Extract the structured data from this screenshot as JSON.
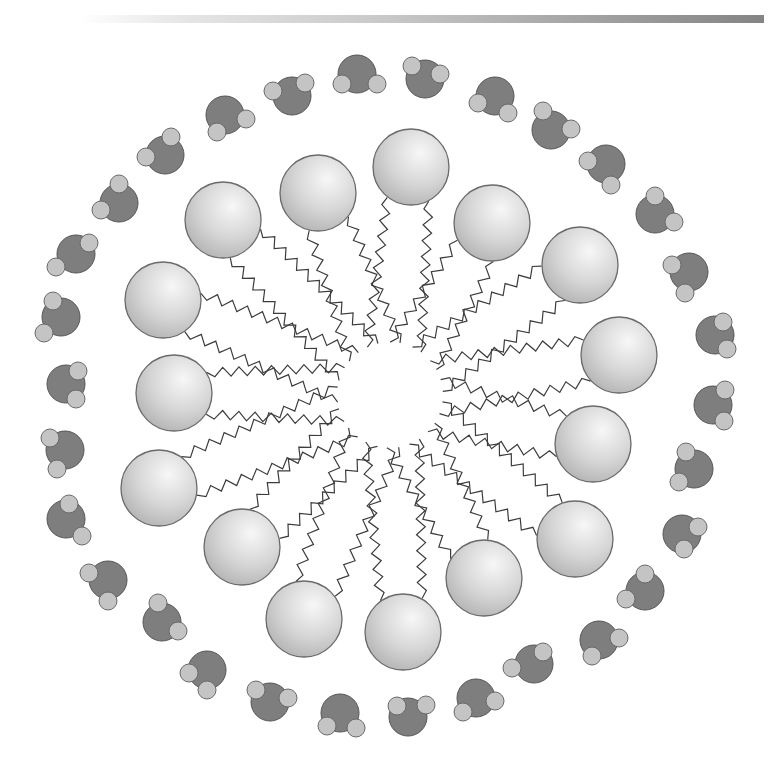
{
  "figure": {
    "title": "",
    "header_bar": {
      "gradient_from": "#ffffff",
      "gradient_to": "#848484"
    }
  },
  "colors": {
    "head_fill_light": "#f2f2f2",
    "head_fill_dark": "#b4b4b4",
    "head_stroke": "#6a6a6a",
    "tail_stroke": "#3c3c3c",
    "oxygen_fill": "#7e7e7e",
    "oxygen_stroke": "#555555",
    "hydrogen_fill": "#c4c4c4",
    "hydrogen_stroke": "#6a6a6a"
  },
  "micelle_center": [
    390,
    395
  ],
  "head_radius": 38,
  "surfactants": [
    {
      "head": [
        223,
        220
      ]
    },
    {
      "head": [
        318,
        193
      ]
    },
    {
      "head": [
        411,
        167
      ]
    },
    {
      "head": [
        492,
        223
      ]
    },
    {
      "head": [
        580,
        265
      ]
    },
    {
      "head": [
        619,
        355
      ]
    },
    {
      "head": [
        593,
        444
      ]
    },
    {
      "head": [
        575,
        539
      ]
    },
    {
      "head": [
        484,
        578
      ]
    },
    {
      "head": [
        403,
        632
      ]
    },
    {
      "head": [
        304,
        619
      ]
    },
    {
      "head": [
        242,
        547
      ]
    },
    {
      "head": [
        159,
        488
      ]
    },
    {
      "head": [
        174,
        393
      ]
    },
    {
      "head": [
        163,
        300
      ]
    }
  ],
  "water_molecules": [
    {
      "o": [
        357,
        74
      ],
      "h1": [
        342,
        84
      ],
      "h2": [
        377,
        84
      ]
    },
    {
      "o": [
        425,
        79
      ],
      "h1": [
        412,
        66
      ],
      "h2": [
        440,
        74
      ]
    },
    {
      "o": [
        495,
        96
      ],
      "h1": [
        478,
        103
      ],
      "h2": [
        508,
        113
      ]
    },
    {
      "o": [
        551,
        130
      ],
      "h1": [
        543,
        111
      ],
      "h2": [
        571,
        129
      ]
    },
    {
      "o": [
        606,
        164
      ],
      "h1": [
        588,
        161
      ],
      "h2": [
        611,
        185
      ]
    },
    {
      "o": [
        655,
        214
      ],
      "h1": [
        655,
        196
      ],
      "h2": [
        674,
        222
      ]
    },
    {
      "o": [
        689,
        272
      ],
      "h1": [
        672,
        265
      ],
      "h2": [
        685,
        293
      ]
    },
    {
      "o": [
        715,
        335
      ],
      "h1": [
        723,
        322
      ],
      "h2": [
        727,
        349
      ]
    },
    {
      "o": [
        713,
        405
      ],
      "h1": [
        725,
        390
      ],
      "h2": [
        724,
        421
      ]
    },
    {
      "o": [
        694,
        469
      ],
      "h1": [
        686,
        452
      ],
      "h2": [
        679,
        482
      ]
    },
    {
      "o": [
        682,
        534
      ],
      "h1": [
        698,
        527
      ],
      "h2": [
        684,
        549
      ]
    },
    {
      "o": [
        645,
        591
      ],
      "h1": [
        645,
        574
      ],
      "h2": [
        626,
        599
      ]
    },
    {
      "o": [
        599,
        640
      ],
      "h1": [
        619,
        638
      ],
      "h2": [
        592,
        656
      ]
    },
    {
      "o": [
        534,
        664
      ],
      "h1": [
        543,
        652
      ],
      "h2": [
        512,
        668
      ]
    },
    {
      "o": [
        476,
        698
      ],
      "h1": [
        495,
        701
      ],
      "h2": [
        463,
        712
      ]
    },
    {
      "o": [
        408,
        717
      ],
      "h1": [
        397,
        706
      ],
      "h2": [
        426,
        705
      ]
    },
    {
      "o": [
        340,
        713
      ],
      "h1": [
        327,
        726
      ],
      "h2": [
        356,
        728
      ]
    },
    {
      "o": [
        270,
        702
      ],
      "h1": [
        256,
        690
      ],
      "h2": [
        288,
        698
      ]
    },
    {
      "o": [
        207,
        670
      ],
      "h1": [
        189,
        673
      ],
      "h2": [
        207,
        690
      ]
    },
    {
      "o": [
        162,
        622
      ],
      "h1": [
        158,
        603
      ],
      "h2": [
        178,
        631
      ]
    },
    {
      "o": [
        108,
        580
      ],
      "h1": [
        89,
        573
      ],
      "h2": [
        108,
        601
      ]
    },
    {
      "o": [
        66,
        519
      ],
      "h1": [
        69,
        504
      ],
      "h2": [
        82,
        536
      ]
    },
    {
      "o": [
        65,
        450
      ],
      "h1": [
        50,
        438
      ],
      "h2": [
        57,
        469
      ]
    },
    {
      "o": [
        66,
        384
      ],
      "h1": [
        78,
        371
      ],
      "h2": [
        76,
        399
      ]
    },
    {
      "o": [
        61,
        317
      ],
      "h1": [
        53,
        301
      ],
      "h2": [
        44,
        333
      ]
    },
    {
      "o": [
        76,
        254
      ],
      "h1": [
        89,
        243
      ],
      "h2": [
        56,
        267
      ]
    },
    {
      "o": [
        119,
        203
      ],
      "h1": [
        101,
        210
      ],
      "h2": [
        119,
        184
      ]
    },
    {
      "o": [
        165,
        155
      ],
      "h1": [
        146,
        157
      ],
      "h2": [
        171,
        137
      ]
    },
    {
      "o": [
        225,
        115
      ],
      "h1": [
        217,
        132
      ],
      "h2": [
        246,
        119
      ]
    },
    {
      "o": [
        292,
        96
      ],
      "h1": [
        273,
        91
      ],
      "h2": [
        305,
        83
      ]
    }
  ]
}
